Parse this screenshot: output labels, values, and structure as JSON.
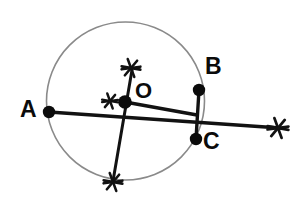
{
  "figure": {
    "canvas": {
      "width": 308,
      "height": 202,
      "background": "#ffffff"
    },
    "colors": {
      "circle_stroke": "#8a8a8a",
      "line_stroke": "#121212",
      "point_fill": "#0b0b0b",
      "label_color": "#0b0b0b"
    },
    "circle": {
      "cx": 125.5,
      "cy": 101,
      "r": 79,
      "stroke_width": 1.6
    },
    "points": [
      {
        "id": "A",
        "label": "A",
        "x": 49,
        "y": 112,
        "r": 6.2
      },
      {
        "id": "B",
        "label": "B",
        "x": 199,
        "y": 90,
        "r": 6.2
      },
      {
        "id": "C",
        "label": "C",
        "x": 196,
        "y": 139,
        "r": 6.2
      },
      {
        "id": "O",
        "label": "O",
        "x": 125,
        "y": 102,
        "r": 6.8
      }
    ],
    "labels": [
      {
        "id": "A",
        "text": "A",
        "x": 20,
        "y": 98
      },
      {
        "id": "B",
        "text": "B",
        "x": 205,
        "y": 55
      },
      {
        "id": "C",
        "text": "C",
        "x": 203,
        "y": 130
      },
      {
        "id": "O",
        "text": "O",
        "x": 135,
        "y": 80
      }
    ],
    "segments": [
      {
        "id": "secant-A-to-right",
        "x1": 49,
        "y1": 112,
        "x2": 280,
        "y2": 128,
        "width": 3.4
      },
      {
        "id": "radius-O-to-BC",
        "x1": 125,
        "y1": 102,
        "x2": 197,
        "y2": 115,
        "width": 3.4
      },
      {
        "id": "chord-B-to-C",
        "x1": 199,
        "y1": 90,
        "x2": 196,
        "y2": 139,
        "width": 3.4
      },
      {
        "id": "perpendicular-bisector",
        "x1": 132,
        "y1": 70,
        "x2": 113,
        "y2": 181,
        "width": 3.0
      }
    ],
    "arc_marks": [
      {
        "id": "arc-mark-top",
        "x": 131,
        "y": 68,
        "size": 9.5,
        "width": 2.6
      },
      {
        "id": "arc-mark-bottom",
        "x": 113,
        "y": 182,
        "size": 9.5,
        "width": 2.6
      },
      {
        "id": "arc-mark-left-of-center",
        "x": 110,
        "y": 101,
        "size": 8.0,
        "width": 2.4
      },
      {
        "id": "arc-mark-right-end",
        "x": 278,
        "y": 128,
        "size": 10.5,
        "width": 2.8
      }
    ]
  }
}
